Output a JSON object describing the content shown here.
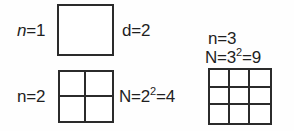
{
  "figure": {
    "background_color": "#fefefe",
    "stroke_color": "#2b2b2b",
    "text_color": "#1f1f1f",
    "width": 294,
    "height": 131
  },
  "groups": [
    {
      "id": "n1",
      "n_label_prefix": "n",
      "n_label_suffix": "=1",
      "n_label_full": "n=1",
      "side_label": "d=2",
      "rows": 1,
      "cols": 1
    },
    {
      "id": "n2",
      "n_label_full": "n=2",
      "count_label_prefix": "N=2",
      "count_label_exponent": "2",
      "count_label_suffix": "=4",
      "count_label_full": "N=2^2=4",
      "rows": 2,
      "cols": 2
    },
    {
      "id": "n3",
      "n_label_full": "n=3",
      "count_label_prefix": "N=3",
      "count_label_exponent": "2",
      "count_label_suffix": "=9",
      "count_label_full": "N=3^2=9",
      "rows": 3,
      "cols": 3
    }
  ]
}
